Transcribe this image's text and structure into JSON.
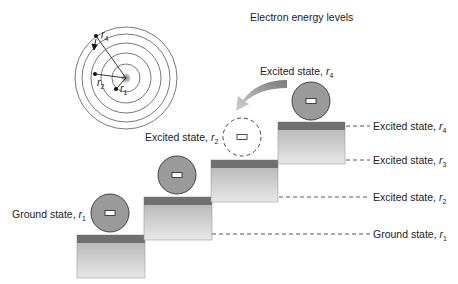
{
  "title": "Electron energy levels",
  "atom": {
    "labels": {
      "r4": "r",
      "r4_sub": "4",
      "r2": "r",
      "r2_sub": "2",
      "r1": "r",
      "r1_sub": "1"
    }
  },
  "left_labels": {
    "ground": {
      "text": "Ground state, ",
      "var": "r",
      "sub": "1"
    },
    "excited_r2": {
      "text": "Excited state, ",
      "var": "r",
      "sub": "2"
    },
    "excited_r4": {
      "text": "Excited state, ",
      "var": "r",
      "sub": "4"
    }
  },
  "level_labels": [
    {
      "text": "Excited state, ",
      "var": "r",
      "sub": "4"
    },
    {
      "text": "Excited state, ",
      "var": "r",
      "sub": "3"
    },
    {
      "text": "Excited state, ",
      "var": "r",
      "sub": "2"
    },
    {
      "text": "Ground state, ",
      "var": "r",
      "sub": "1"
    }
  ],
  "colors": {
    "ball_fill": "#9a9a9a",
    "block_top": "#707070",
    "block_gradient_top": "#b4b4b4",
    "block_gradient_bottom": "#e6e6e6"
  }
}
